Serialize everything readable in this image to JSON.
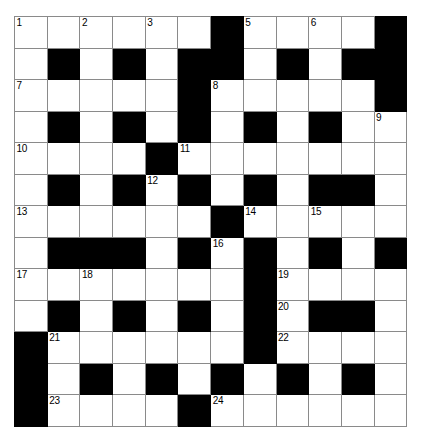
{
  "puzzle": {
    "title": "Crossword Grid",
    "rows": 12,
    "cols": 12,
    "cell_size_px": 32.7,
    "colors": {
      "block": "#000000",
      "empty": "#ffffff",
      "grid_line": "#8a8a8a",
      "number_text": "#000000"
    },
    "grid": [
      [
        "o",
        "o",
        "o",
        "o",
        "o",
        "o",
        "x",
        "o",
        "o",
        "o",
        "o",
        "x"
      ],
      [
        "o",
        "x",
        "o",
        "x",
        "o",
        "x",
        "x",
        "o",
        "x",
        "o",
        "x",
        "x"
      ],
      [
        "o",
        "o",
        "o",
        "o",
        "o",
        "x",
        "o",
        "o",
        "o",
        "o",
        "o",
        "x"
      ],
      [
        "o",
        "x",
        "o",
        "x",
        "o",
        "x",
        "o",
        "x",
        "o",
        "x",
        "o",
        "o"
      ],
      [
        "o",
        "o",
        "o",
        "o",
        "x",
        "o",
        "o",
        "o",
        "o",
        "o",
        "o",
        "o"
      ],
      [
        "o",
        "x",
        "o",
        "x",
        "o",
        "x",
        "o",
        "x",
        "o",
        "x",
        "x",
        "o"
      ],
      [
        "o",
        "o",
        "o",
        "o",
        "o",
        "o",
        "x",
        "o",
        "o",
        "o",
        "o",
        "o"
      ],
      [
        "o",
        "x",
        "x",
        "x",
        "o",
        "x",
        "o",
        "x",
        "o",
        "x",
        "o",
        "x"
      ],
      [
        "o",
        "o",
        "o",
        "o",
        "o",
        "o",
        "o",
        "x",
        "o",
        "o",
        "o",
        "o"
      ],
      [
        "o",
        "x",
        "o",
        "x",
        "o",
        "x",
        "o",
        "x",
        "o",
        "x",
        "x",
        "o"
      ],
      [
        "x",
        "o",
        "o",
        "o",
        "o",
        "o",
        "o",
        "x",
        "o",
        "o",
        "o",
        "o"
      ],
      [
        "x",
        "o",
        "x",
        "o",
        "x",
        "o",
        "x",
        "o",
        "x",
        "o",
        "x",
        "o"
      ],
      [
        "x",
        "o",
        "o",
        "o",
        "o",
        "x",
        "o",
        "o",
        "o",
        "o",
        "o",
        "o"
      ]
    ],
    "numbers": [
      {
        "n": "1",
        "row": 1,
        "col": 1
      },
      {
        "n": "2",
        "row": 1,
        "col": 3
      },
      {
        "n": "3",
        "row": 1,
        "col": 5
      },
      {
        "n": "4",
        "row": 1,
        "col": 7
      },
      {
        "n": "5",
        "row": 1,
        "col": 8
      },
      {
        "n": "6",
        "row": 1,
        "col": 10
      },
      {
        "n": "7",
        "row": 3,
        "col": 1
      },
      {
        "n": "8",
        "row": 3,
        "col": 7
      },
      {
        "n": "9",
        "row": 4,
        "col": 12
      },
      {
        "n": "10",
        "row": 5,
        "col": 1
      },
      {
        "n": "11",
        "row": 5,
        "col": 6
      },
      {
        "n": "12",
        "row": 6,
        "col": 5
      },
      {
        "n": "13",
        "row": 7,
        "col": 1
      },
      {
        "n": "14",
        "row": 7,
        "col": 8
      },
      {
        "n": "15",
        "row": 7,
        "col": 10
      },
      {
        "n": "16",
        "row": 8,
        "col": 7
      },
      {
        "n": "17",
        "row": 9,
        "col": 1
      },
      {
        "n": "18",
        "row": 9,
        "col": 3
      },
      {
        "n": "19",
        "row": 9,
        "col": 9
      },
      {
        "n": "20",
        "row": 10,
        "col": 9
      },
      {
        "n": "21",
        "row": 11,
        "col": 2
      },
      {
        "n": "22",
        "row": 11,
        "col": 9
      },
      {
        "n": "23",
        "row": 13,
        "col": 2
      },
      {
        "n": "24",
        "row": 13,
        "col": 7
      }
    ]
  }
}
